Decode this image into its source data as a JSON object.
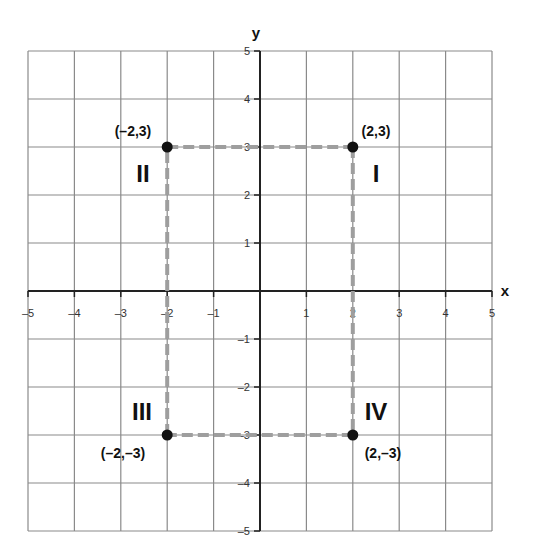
{
  "diagram": {
    "type": "coordinate-plane",
    "x_axis_label": "x",
    "y_axis_label": "y",
    "x_range": [
      -5,
      5
    ],
    "y_range": [
      -5,
      5
    ],
    "x_ticks": [
      "–5",
      "–4",
      "–3",
      "–2",
      "–1",
      "",
      "1",
      "2",
      "3",
      "4",
      "5"
    ],
    "y_ticks": [
      "5",
      "4",
      "3",
      "2",
      "1",
      "",
      "–1",
      "–2",
      "–3",
      "–4",
      "–5"
    ],
    "points": [
      {
        "x": -2,
        "y": 3,
        "label": "(–2,3)"
      },
      {
        "x": 2,
        "y": 3,
        "label": "(2,3)"
      },
      {
        "x": -2,
        "y": -3,
        "label": "(–2,–3)"
      },
      {
        "x": 2,
        "y": -3,
        "label": "(2,–3)"
      }
    ],
    "quadrants": [
      {
        "name": "I",
        "label": "I"
      },
      {
        "name": "II",
        "label": "II"
      },
      {
        "name": "III",
        "label": "III"
      },
      {
        "name": "IV",
        "label": "IV"
      }
    ],
    "rectangle": {
      "vertices": [
        [
          -2,
          3
        ],
        [
          2,
          3
        ],
        [
          2,
          -3
        ],
        [
          -2,
          -3
        ]
      ],
      "style": "dashed"
    },
    "colors": {
      "grid": "#8a8a8a",
      "axis": "#222222",
      "dash": "#9e9e9e",
      "point": "#111111",
      "text": "#111111"
    }
  }
}
